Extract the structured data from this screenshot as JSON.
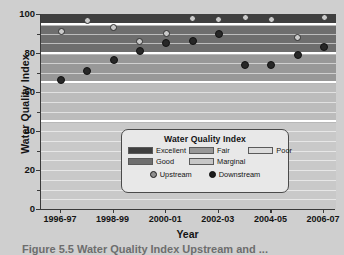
{
  "figure": {
    "caption": "Figure 5.5   Water Quality Index Upstream and ..."
  },
  "chart_data": {
    "type": "scatter",
    "title": "",
    "xlabel": "Year",
    "ylabel": "Water Quality Index",
    "ylim": [
      0,
      100
    ],
    "ytick_values": [
      0,
      20,
      40,
      60,
      80,
      100
    ],
    "ytick_labels": [
      "0",
      "20",
      "40",
      "60",
      "80",
      "100"
    ],
    "yminor_values": [
      10,
      30,
      50,
      70,
      90
    ],
    "grid": true,
    "legend_position": "lower-right-inside",
    "categories": [
      "1996-97",
      "1997-98",
      "1998-99",
      "1999-00",
      "2000-01",
      "2001-02",
      "2002-03",
      "2003-04",
      "2004-05",
      "2005-06",
      "2006-07"
    ],
    "xtick_labels": [
      "1996-97",
      "1998-99",
      "2000-01",
      "2002-03",
      "2004-05",
      "2006-07"
    ],
    "series": [
      {
        "name": "Upstream",
        "marker": "open-circle",
        "color": "#cacaca",
        "values": [
          91,
          96.5,
          93,
          86,
          90,
          97.5,
          97,
          98,
          97,
          88,
          98
        ]
      },
      {
        "name": "Downstream",
        "marker": "filled-circle",
        "color": "#272727",
        "values": [
          66,
          71,
          76.5,
          81,
          85,
          86,
          90,
          74,
          74,
          79,
          83
        ]
      }
    ],
    "bands": [
      {
        "label": "Excellent",
        "min": 95,
        "max": 100,
        "color": "#3f3f3f"
      },
      {
        "label": "Good",
        "min": 80,
        "max": 94,
        "color": "#6e6e6e"
      },
      {
        "label": "Fair",
        "min": 65,
        "max": 79,
        "color": "#989898"
      },
      {
        "label": "Marginal",
        "min": 45,
        "max": 64,
        "color": "#bcbcbc"
      },
      {
        "label": "Poor",
        "min": 0,
        "max": 44,
        "color": "#c9c9c9"
      }
    ]
  },
  "legend": {
    "title": "Water Quality Index",
    "bands": [
      {
        "label": "Excellent",
        "color": "#3f3f3f"
      },
      {
        "label": "Fair",
        "color": "#989898"
      },
      {
        "label": "Poor",
        "color": "#dcdcdc"
      },
      {
        "label": "Good",
        "color": "#6e6e6e"
      },
      {
        "label": "Marginal",
        "color": "#c6c6c6"
      }
    ],
    "series": [
      {
        "label": "Upstream",
        "marker": "open-circle"
      },
      {
        "label": "Downstream",
        "marker": "filled-circle"
      }
    ]
  }
}
